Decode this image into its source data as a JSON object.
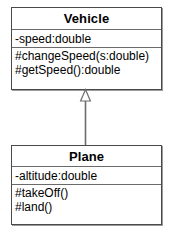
{
  "diagram": {
    "type": "uml-class-diagram",
    "background_color": "#ffffff",
    "line_color": "#4a4a4a",
    "text_color": "#000000"
  },
  "classes": [
    {
      "id": "vehicle",
      "name": "Vehicle",
      "attributes": [
        {
          "text": "-speed:double",
          "visibility": "private"
        }
      ],
      "operations": [
        {
          "text": "#changeSpeed(s:double)",
          "visibility": "protected"
        },
        {
          "text": "#getSpeed():double",
          "visibility": "protected"
        }
      ]
    },
    {
      "id": "plane",
      "name": "Plane",
      "attributes": [
        {
          "text": "-altitude:double",
          "visibility": "private"
        }
      ],
      "operations": [
        {
          "text": "#takeOff()",
          "visibility": "protected"
        },
        {
          "text": "#land()",
          "visibility": "protected"
        }
      ]
    }
  ],
  "relationships": [
    {
      "id": "plane-extends-vehicle",
      "kind": "generalization",
      "label": "",
      "source": "Plane",
      "target": "Vehicle",
      "arrowhead": "hollow-triangle"
    }
  ]
}
